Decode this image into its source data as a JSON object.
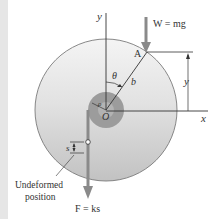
{
  "figure": {
    "labels": {
      "y_axis": "y",
      "x_axis": "x",
      "weight": "W = mg",
      "point_a": "A",
      "theta": "θ",
      "arm_length": "b",
      "hub_radius": "ρ",
      "origin": "O",
      "height": "y",
      "spring_stretch": "s",
      "undeformed_line1": "Undeformed",
      "undeformed_line2": "position",
      "spring_force": "F = ks"
    },
    "colors": {
      "disk_top": "#f2f2f2",
      "disk_bottom": "#c4c4c4",
      "disk_outline": "#7a7a7a",
      "hub": "#9a9a9a",
      "hub_inner": "#b5b5b5",
      "force_arrow": "#8a8a8a",
      "line": "#333333",
      "left_band": "#e6e6e6"
    }
  }
}
